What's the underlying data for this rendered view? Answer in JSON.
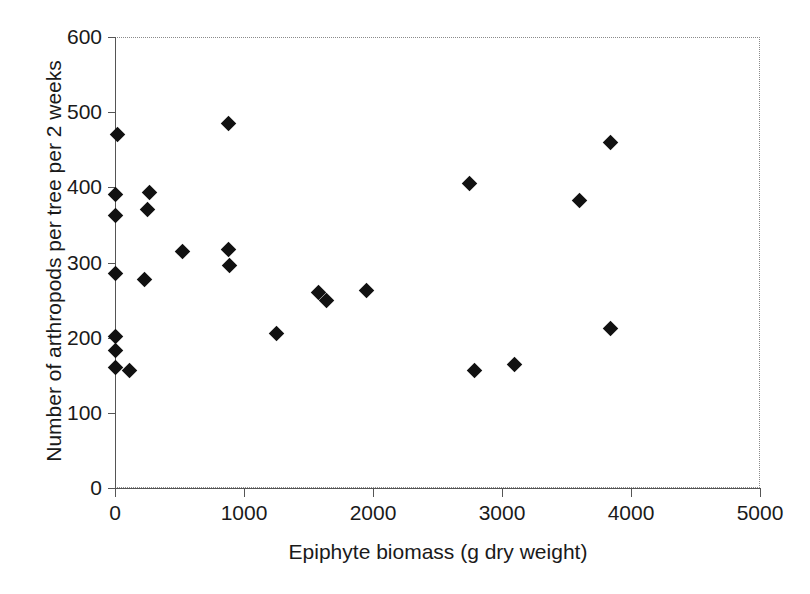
{
  "chart_data": {
    "type": "scatter",
    "title": "",
    "xlabel": "Epiphyte biomass (g dry weight)",
    "ylabel": "Number of arthropods per tree per 2 weeks",
    "xlim": [
      0,
      5000
    ],
    "ylim": [
      0,
      600
    ],
    "xticks": [
      0,
      1000,
      2000,
      3000,
      4000,
      5000
    ],
    "yticks": [
      0,
      100,
      200,
      300,
      400,
      500,
      600
    ],
    "xtick_labels": [
      "0",
      "1000",
      "2000",
      "3000",
      "4000",
      "5000"
    ],
    "ytick_labels": [
      "0",
      "100",
      "200",
      "300",
      "400",
      "500",
      "600"
    ],
    "grid": false,
    "legend": null,
    "marker": "diamond",
    "marker_color": "#111111",
    "points": [
      {
        "x": 20,
        "y": 470
      },
      {
        "x": 0,
        "y": 390
      },
      {
        "x": 0,
        "y": 362
      },
      {
        "x": 0,
        "y": 285
      },
      {
        "x": 0,
        "y": 201
      },
      {
        "x": 0,
        "y": 183
      },
      {
        "x": 0,
        "y": 160
      },
      {
        "x": 110,
        "y": 157
      },
      {
        "x": 230,
        "y": 278
      },
      {
        "x": 250,
        "y": 370
      },
      {
        "x": 270,
        "y": 393
      },
      {
        "x": 520,
        "y": 315
      },
      {
        "x": 880,
        "y": 485
      },
      {
        "x": 880,
        "y": 317
      },
      {
        "x": 890,
        "y": 296
      },
      {
        "x": 1250,
        "y": 205
      },
      {
        "x": 1580,
        "y": 260
      },
      {
        "x": 1640,
        "y": 249
      },
      {
        "x": 1950,
        "y": 263
      },
      {
        "x": 2750,
        "y": 405
      },
      {
        "x": 2790,
        "y": 157
      },
      {
        "x": 3100,
        "y": 165
      },
      {
        "x": 3600,
        "y": 383
      },
      {
        "x": 3840,
        "y": 460
      },
      {
        "x": 3840,
        "y": 212
      }
    ]
  },
  "axes": {
    "x_title": "Epiphyte biomass (g dry weight)",
    "y_title": "Number of arthropods per tree per 2 weeks"
  },
  "colors": {
    "marker": "#111111",
    "axis": "#555555",
    "frame": "#8a8a8a",
    "text": "#1a1a1a",
    "background": "#ffffff"
  }
}
